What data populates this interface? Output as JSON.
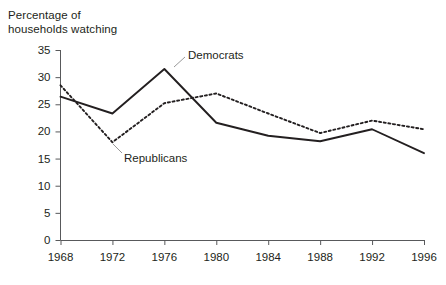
{
  "chart_data": {
    "type": "line",
    "title": "",
    "xlabel": "",
    "ylabel": "Percentage of\nhouseholds watching",
    "x": [
      1968,
      1972,
      1976,
      1980,
      1984,
      1988,
      1992,
      1996
    ],
    "categories": [
      "1968",
      "1972",
      "1976",
      "1980",
      "1984",
      "1988",
      "1992",
      "1996"
    ],
    "xlim": [
      1968,
      1996
    ],
    "ylim": [
      0,
      35
    ],
    "y_ticks": [
      0,
      5,
      10,
      15,
      20,
      25,
      30,
      35
    ],
    "y_tick_labels": [
      "0",
      "5",
      "10",
      "15",
      "20",
      "25",
      "30",
      "35"
    ],
    "grid": false,
    "legend_position": "inline-annotations",
    "series": [
      {
        "name": "Democrats",
        "style": "solid",
        "color": "#231f20",
        "values": [
          26.4,
          23.3,
          31.5,
          21.6,
          19.2,
          18.2,
          20.4,
          16.0
        ]
      },
      {
        "name": "Republicans",
        "style": "dotted",
        "color": "#231f20",
        "values": [
          28.5,
          18.0,
          25.2,
          27.0,
          23.3,
          19.7,
          22.0,
          20.4
        ]
      }
    ],
    "annotations": [
      {
        "text": "Democrats",
        "target_series": "Democrats",
        "target_x": 1976
      },
      {
        "text": "Republicans",
        "target_series": "Republicans",
        "target_x": 1972
      }
    ]
  }
}
